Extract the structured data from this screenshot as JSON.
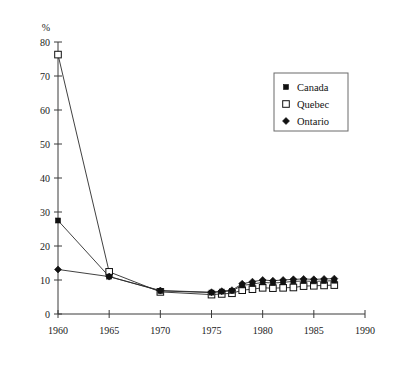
{
  "chart_data": {
    "type": "line",
    "title": "",
    "xlabel": "",
    "ylabel": "%",
    "xlim": [
      1960,
      1990
    ],
    "ylim": [
      0,
      80
    ],
    "xticks": [
      1960,
      1965,
      1970,
      1975,
      1980,
      1985,
      1990
    ],
    "yticks": [
      0,
      10,
      20,
      30,
      40,
      50,
      60,
      70,
      80
    ],
    "grid": false,
    "legend_position": "upper-right",
    "series": [
      {
        "name": "Canada",
        "marker": "filled-square",
        "color": "#111111",
        "x": [
          1960,
          1965,
          1970,
          1975,
          1976,
          1977,
          1978,
          1979,
          1980,
          1981,
          1982,
          1983,
          1984,
          1985,
          1986,
          1987
        ],
        "values": [
          27.5,
          11.0,
          6.8,
          6.3,
          6.6,
          6.8,
          8.4,
          8.8,
          9.3,
          9.1,
          9.3,
          9.6,
          9.7,
          9.6,
          9.7,
          9.8
        ]
      },
      {
        "name": "Quebec",
        "marker": "open-square",
        "color": "#111111",
        "x": [
          1960,
          1965,
          1970,
          1975,
          1976,
          1977,
          1978,
          1979,
          1980,
          1981,
          1982,
          1983,
          1984,
          1985,
          1986,
          1987
        ],
        "values": [
          76.3,
          12.4,
          6.5,
          5.7,
          5.9,
          6.1,
          7.0,
          7.3,
          7.7,
          7.6,
          7.7,
          7.8,
          8.2,
          8.3,
          8.4,
          8.5
        ]
      },
      {
        "name": "Ontario",
        "marker": "filled-diamond",
        "color": "#111111",
        "x": [
          1960,
          1965,
          1970,
          1975,
          1976,
          1977,
          1978,
          1979,
          1980,
          1981,
          1982,
          1983,
          1984,
          1985,
          1986,
          1987
        ],
        "values": [
          13.1,
          11.0,
          6.9,
          6.4,
          6.7,
          7.0,
          8.9,
          9.5,
          10.0,
          9.8,
          10.0,
          10.2,
          10.3,
          10.2,
          10.3,
          10.4
        ]
      }
    ]
  },
  "legend": {
    "entries": [
      {
        "label": "Canada",
        "marker": "filled-square"
      },
      {
        "label": "Quebec",
        "marker": "open-square"
      },
      {
        "label": "Ontario",
        "marker": "filled-diamond"
      }
    ]
  },
  "axis": {
    "y_unit_label": "%",
    "x_tick_labels": [
      "1960",
      "1965",
      "1970",
      "1975",
      "1980",
      "1985",
      "1990"
    ],
    "y_tick_labels": [
      "0",
      "10",
      "20",
      "30",
      "40",
      "50",
      "60",
      "70",
      "80"
    ]
  }
}
